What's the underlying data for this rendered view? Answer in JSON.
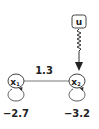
{
  "diagram": {
    "input_node": {
      "label": "u"
    },
    "nodes": [
      {
        "id": "x1",
        "label": "x",
        "subscript": "1",
        "self_loop_weight": "−2.7"
      },
      {
        "id": "x2",
        "label": "x",
        "subscript": "2",
        "self_loop_weight": "−3.2"
      }
    ],
    "edges": [
      {
        "from": "x1",
        "to": "x2",
        "weight": "1.3",
        "type": "undirected"
      },
      {
        "from": "u",
        "to": "x2",
        "type": "wavy-arrow"
      }
    ],
    "colors": {
      "stroke": "#333333",
      "text": "#222222",
      "background": "#ffffff"
    }
  }
}
